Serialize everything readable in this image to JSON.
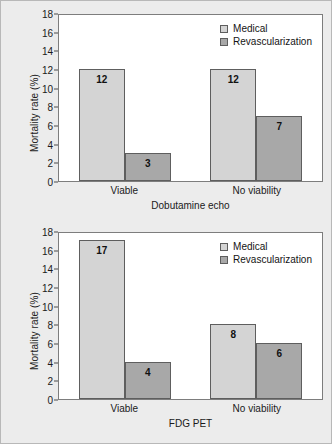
{
  "figure": {
    "background_color": "#ececec",
    "frame_color": "#b8b8b8"
  },
  "legend": {
    "medical_label": "Medical",
    "revascularization_label": "Revascularization",
    "medical_color": "#d4d4d4",
    "revascularization_color": "#a8a8a8"
  },
  "axis": {
    "ylabel": "Mortality rate (%)",
    "ticks": [
      "0",
      "2",
      "4",
      "6",
      "8",
      "10",
      "12",
      "14",
      "16",
      "18"
    ]
  },
  "chart_data": [
    {
      "type": "bar",
      "title": "",
      "xlabel": "Dobutamine echo",
      "ylabel": "Mortality rate (%)",
      "categories": [
        "Viable",
        "No viability"
      ],
      "series": [
        {
          "name": "Medical",
          "values": [
            12,
            12
          ],
          "color": "#d4d4d4"
        },
        {
          "name": "Revascularization",
          "values": [
            3,
            7
          ],
          "color": "#a8a8a8"
        }
      ],
      "ylim": [
        0,
        18
      ],
      "ytick_step": 2,
      "grid": false,
      "legend_position": "top-right",
      "bar_labels": [
        [
          "12",
          "12"
        ],
        [
          "3",
          "7"
        ]
      ]
    },
    {
      "type": "bar",
      "title": "",
      "xlabel": "FDG PET",
      "ylabel": "Mortality rate (%)",
      "categories": [
        "Viable",
        "No viability"
      ],
      "series": [
        {
          "name": "Medical",
          "values": [
            17,
            8
          ],
          "color": "#d4d4d4"
        },
        {
          "name": "Revascularization",
          "values": [
            4,
            6
          ],
          "color": "#a8a8a8"
        }
      ],
      "ylim": [
        0,
        18
      ],
      "ytick_step": 2,
      "grid": false,
      "legend_position": "top-right",
      "bar_labels": [
        [
          "17",
          "8"
        ],
        [
          "4",
          "6"
        ]
      ]
    }
  ]
}
